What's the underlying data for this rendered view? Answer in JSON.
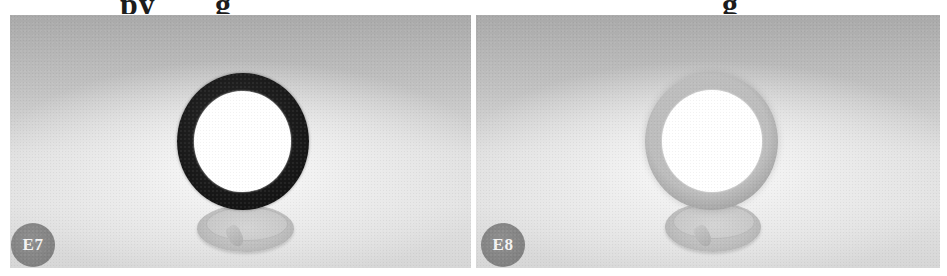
{
  "figure": {
    "top_caption_note": "cropped heading text above panels, only descenders visible",
    "top_caption_fragments": [
      "py",
      "g",
      "g"
    ],
    "panels": [
      {
        "id": "E7",
        "label": "E7",
        "subject": "ring on pedestal base",
        "ring_style": "dark",
        "ring_color": "#151515",
        "hole_color": "#ffffff",
        "badge_color": "#808080"
      },
      {
        "id": "E8",
        "label": "E8",
        "subject": "ring on pedestal base",
        "ring_style": "soft-grey",
        "ring_color": "#ababab",
        "hole_color": "#ffffff",
        "badge_color": "#808080"
      }
    ],
    "background_gradient": [
      "#a9a9a9",
      "#f5f5f5"
    ]
  }
}
